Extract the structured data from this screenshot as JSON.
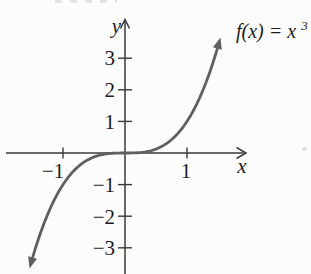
{
  "figure": {
    "function_label_body": "f(x) = x",
    "function_label_exponent": "3"
  },
  "chart_data": {
    "type": "line",
    "function_label": "f(x) = x³",
    "equation": "y = x^3",
    "exponent": 3,
    "xlabel": "x",
    "ylabel": "y",
    "grid": false,
    "x_ticks": [
      -1,
      1
    ],
    "x_tick_labels": [
      "−1",
      "1"
    ],
    "y_ticks": [
      3,
      2,
      1,
      -1,
      -2,
      -3
    ],
    "y_tick_labels": [
      "3",
      "2",
      "1",
      "−1",
      "−2",
      "−3"
    ],
    "xlim": [
      -1.9,
      1.95
    ],
    "ylim": [
      -3.8,
      4.2
    ],
    "domain": [
      -1.54,
      1.54
    ],
    "series": [
      {
        "name": "f(x) = x³",
        "points": [
          {
            "x": -1.5,
            "y": -3.375
          },
          {
            "x": -1.25,
            "y": -1.953
          },
          {
            "x": -1,
            "y": -1
          },
          {
            "x": -0.75,
            "y": -0.422
          },
          {
            "x": -0.5,
            "y": -0.125
          },
          {
            "x": -0.25,
            "y": -0.016
          },
          {
            "x": 0,
            "y": 0
          },
          {
            "x": 0.25,
            "y": 0.016
          },
          {
            "x": 0.5,
            "y": 0.125
          },
          {
            "x": 0.75,
            "y": 0.422
          },
          {
            "x": 1,
            "y": 1
          },
          {
            "x": 1.25,
            "y": 1.953
          },
          {
            "x": 1.5,
            "y": 3.375
          }
        ]
      }
    ],
    "axis_color": "#3a3a3a",
    "curve_color": "#5f5f5f",
    "text_color": "#1c1c1c"
  }
}
